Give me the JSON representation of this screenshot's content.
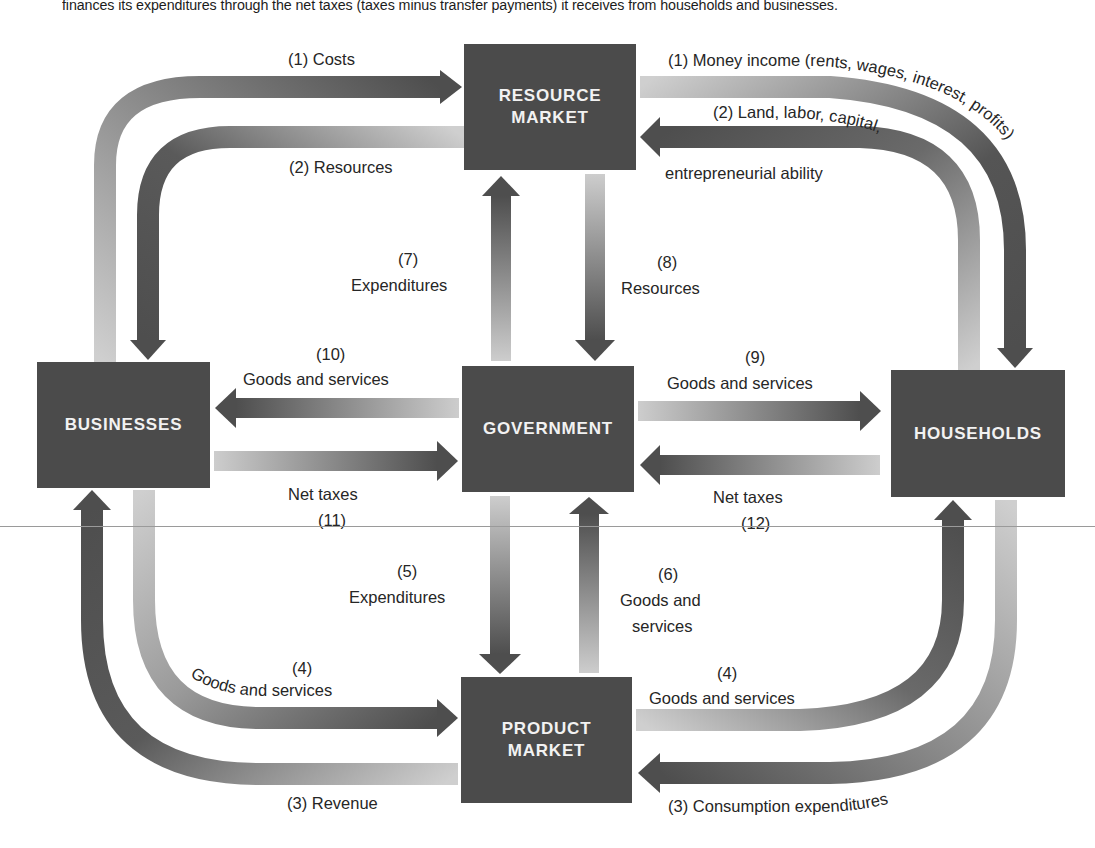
{
  "caption": "finances its expenditures through the net taxes (taxes minus transfer payments) it receives from households and businesses.",
  "colors": {
    "box": "#4b4b4b",
    "box_text": "#f2f2f2",
    "arrow_dark": "#4e4e4e",
    "arrow_light": "#c9c9c9",
    "text": "#262626"
  },
  "boxes": {
    "resource_market": "RESOURCE\nMARKET",
    "businesses": "BUSINESSES",
    "government": "GOVERNMENT",
    "households": "HOUSEHOLDS",
    "product_market": "PRODUCT\nMARKET"
  },
  "flows": {
    "costs": "(1) Costs",
    "resources_2": "(2) Resources",
    "money_income": "(1) Money income (rents, wages, interest, profits)",
    "land_labor_line1": "(2) Land, labor, capital,",
    "land_labor_line2": "entrepreneurial ability",
    "expenditures_7_num": "(7)",
    "expenditures_7": "Expenditures",
    "resources_8_num": "(8)",
    "resources_8": "Resources",
    "goods_10_num": "(10)",
    "goods_10": "Goods and services",
    "goods_9_num": "(9)",
    "goods_9": "Goods and services",
    "net_taxes_11": "Net taxes",
    "net_taxes_11_num": "(11)",
    "net_taxes_12": "Net taxes",
    "net_taxes_12_num": "(12)",
    "expenditures_5_num": "(5)",
    "expenditures_5": "Expenditures",
    "goods_6_num": "(6)",
    "goods_6_line1": "Goods and",
    "goods_6_line2": "services",
    "goods_4_left_num": "(4)",
    "goods_4_left": "Goods and services",
    "goods_4_right_num": "(4)",
    "goods_4_right": "Goods and services",
    "revenue_3": "(3) Revenue",
    "consumption_3": "(3) Consumption expenditures"
  }
}
